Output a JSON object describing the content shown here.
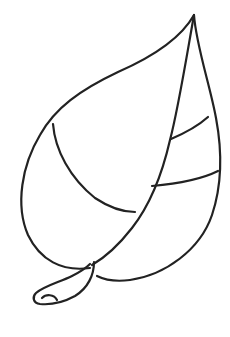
{
  "image": {
    "subject": "leaf-outline-coloring-page",
    "background_color": "#ffffff",
    "line_color": "#222222",
    "parts": [
      "outline",
      "midrib",
      "left-vein",
      "right-vein-upper",
      "right-vein-lower",
      "stem"
    ]
  }
}
